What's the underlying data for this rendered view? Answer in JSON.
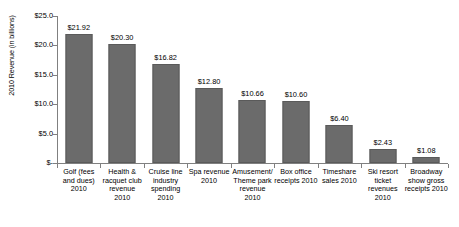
{
  "chart_data": {
    "type": "bar",
    "title": "",
    "xlabel": "",
    "ylabel": "2010 Revenue (in billions)",
    "ylim": [
      0,
      25
    ],
    "grid": false,
    "legend": false,
    "bar_color": "#6b6b6b",
    "axis_color": "#808080",
    "categories": [
      "Golf (fees and dues) 2010",
      "Health & racquet club revenue 2010",
      "Cruise line industry spending 2010",
      "Spa revenue 2010",
      "Amusement/ Theme park revenue 2010",
      "Box office receipts 2010",
      "Timeshare sales 2010",
      "Ski resort ticket revenues 2010",
      "Broadway show gross receipts 2010"
    ],
    "values": [
      21.92,
      20.3,
      16.82,
      12.8,
      10.66,
      10.6,
      6.4,
      2.43,
      1.08
    ],
    "value_labels": [
      "$21.92",
      "$20.30",
      "$16.82",
      "$12.80",
      "$10.66",
      "$10.60",
      "$6.40",
      "$2.43",
      "$1.08"
    ],
    "y_ticks": [
      25,
      20,
      15,
      10,
      5,
      0
    ],
    "y_tick_labels": [
      "$25.0",
      "$20.0",
      "$15.0",
      "$10.0",
      "$5.0",
      "$-"
    ]
  }
}
